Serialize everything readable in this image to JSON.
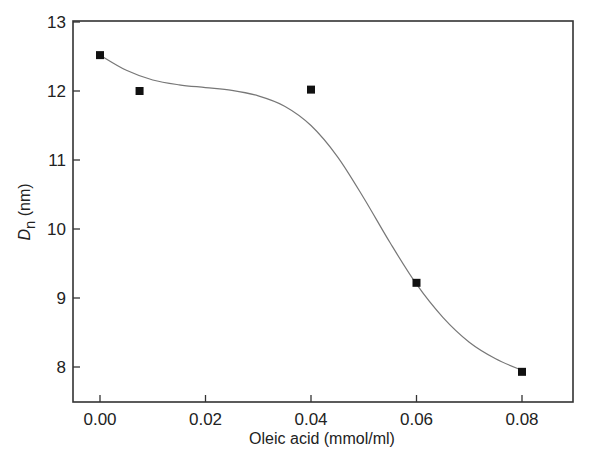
{
  "chart_data": {
    "type": "scatter",
    "title": "",
    "xlabel": "Oleic acid (mmol/ml)",
    "ylabel": "D_n (nm)",
    "ylabel_parts": {
      "main": "D",
      "subscript": "n",
      "unit": " (nm)"
    },
    "xlim": [
      -0.005,
      0.09
    ],
    "ylim": [
      7.5,
      13
    ],
    "xticks": [
      0.0,
      0.02,
      0.04,
      0.06,
      0.08
    ],
    "xtick_labels": [
      "0.00",
      "0.02",
      "0.04",
      "0.06",
      "0.08"
    ],
    "yticks": [
      8,
      9,
      10,
      11,
      12,
      13
    ],
    "ytick_labels": [
      "8",
      "9",
      "10",
      "11",
      "12",
      "13"
    ],
    "grid": false,
    "legend": null,
    "series": [
      {
        "name": "measured",
        "marker": "square",
        "color": "#111111",
        "x": [
          0.0,
          0.0075,
          0.04,
          0.06,
          0.08
        ],
        "y": [
          12.52,
          12.0,
          12.02,
          9.22,
          7.93
        ]
      },
      {
        "name": "fit curve",
        "style": "line",
        "color": "#777777",
        "x": [
          0.0,
          0.005,
          0.01,
          0.015,
          0.02,
          0.025,
          0.03,
          0.035,
          0.04,
          0.045,
          0.05,
          0.055,
          0.06,
          0.065,
          0.07,
          0.075,
          0.08
        ],
        "y": [
          12.52,
          12.3,
          12.16,
          12.09,
          12.05,
          12.01,
          11.93,
          11.78,
          11.5,
          11.05,
          10.45,
          9.8,
          9.2,
          8.72,
          8.36,
          8.12,
          7.95
        ]
      }
    ]
  }
}
